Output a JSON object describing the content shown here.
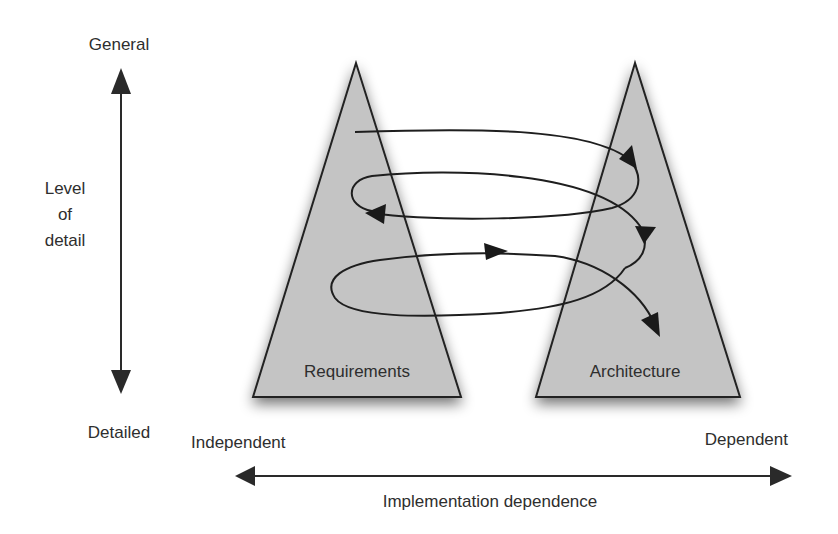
{
  "diagram": {
    "vertical_axis": {
      "top_label": "General",
      "bottom_label": "Detailed",
      "name_line1": "Level",
      "name_line2": "of",
      "name_line3": "detail"
    },
    "horizontal_axis": {
      "left_label": "Independent",
      "right_label": "Dependent",
      "name": "Implementation dependence"
    },
    "triangles": [
      {
        "label": "Requirements",
        "fill": "#c4c4c4"
      },
      {
        "label": "Architecture",
        "fill": "#c4c4c4"
      }
    ],
    "spiral": {
      "description": "Twin peaks spiral alternating between requirements and architecture",
      "arrow_count": 5
    }
  }
}
